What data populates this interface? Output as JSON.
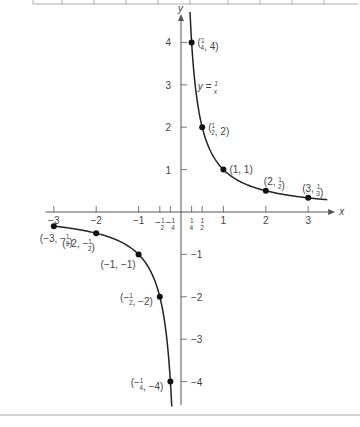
{
  "chart_data": {
    "type": "line",
    "title": "",
    "equation_label": "y = 1/x",
    "xlabel": "x",
    "ylabel": "y",
    "xlim": [
      -3.1,
      3.4
    ],
    "ylim": [
      -4.5,
      4.5
    ],
    "grid": false,
    "x_ticks": [
      {
        "value": -3,
        "label": "-3"
      },
      {
        "value": -2,
        "label": "-2"
      },
      {
        "value": -1,
        "label": "-1"
      },
      {
        "value": -0.5,
        "label": "-1/2"
      },
      {
        "value": -0.25,
        "label": "-1/4"
      },
      {
        "value": 0.25,
        "label": "1/4"
      },
      {
        "value": 0.5,
        "label": "1/2"
      },
      {
        "value": 1,
        "label": "1"
      },
      {
        "value": 2,
        "label": "2"
      },
      {
        "value": 3,
        "label": "3"
      }
    ],
    "y_ticks": [
      {
        "value": 4,
        "label": "4"
      },
      {
        "value": 3,
        "label": "3"
      },
      {
        "value": 2,
        "label": "2"
      },
      {
        "value": 1,
        "label": "1"
      },
      {
        "value": -1,
        "label": "-1"
      },
      {
        "value": -2,
        "label": "-2"
      },
      {
        "value": -3,
        "label": "-3"
      },
      {
        "value": -4,
        "label": "-4"
      }
    ],
    "series": [
      {
        "name": "y = 1/x",
        "points": [
          {
            "x": 0.25,
            "y": 4,
            "label": "(1/4, 4)"
          },
          {
            "x": 0.5,
            "y": 2,
            "label": "(1/2, 2)"
          },
          {
            "x": 1,
            "y": 1,
            "label": "(1, 1)"
          },
          {
            "x": 2,
            "y": 0.5,
            "label": "(2, 1/2)"
          },
          {
            "x": 3,
            "y": 0.3333,
            "label": "(3, 1/3)"
          },
          {
            "x": -3,
            "y": -0.3333,
            "label": "(-3, -1/3)"
          },
          {
            "x": -2,
            "y": -0.5,
            "label": "(-2, -1/2)"
          },
          {
            "x": -1,
            "y": -1,
            "label": "(-1, -1)"
          },
          {
            "x": -0.5,
            "y": -2,
            "label": "(-1/2, -2)"
          },
          {
            "x": -0.25,
            "y": -4,
            "label": "(-1/4, -4)"
          }
        ]
      }
    ]
  }
}
